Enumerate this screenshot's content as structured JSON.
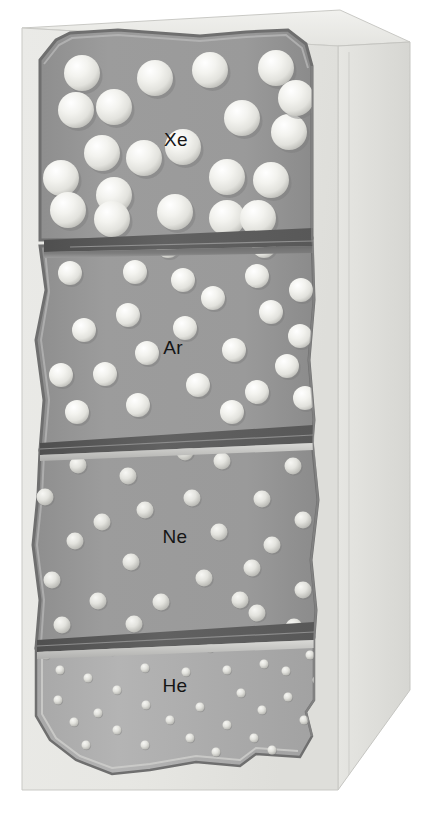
{
  "figure": {
    "background_color": "#ffffff",
    "outer_panel_color": "#e9e9e6",
    "outer_panel_shadow_color": "#dcdcd8",
    "outer_panel_edge_color": "#bdbdb8",
    "chamber_fill_color": "#9a9a9a",
    "chamber_fill_light_color": "#b2b2b2",
    "chamber_outline_color": "#6f6f6f",
    "divider_dark_color": "#5a5a5a",
    "divider_mid_color": "#777777",
    "divider_light_color": "#c8c8c8",
    "sphere_color": "#f0f0ec",
    "sphere_shade_color": "#bcbcba",
    "label_color": "#151515"
  },
  "chambers": [
    {
      "id": "xe",
      "label": "Xe",
      "element_name": "xenon",
      "label_x": 176,
      "label_y": 146,
      "sphere_radius": 18,
      "sphere_count": 21,
      "spheres": [
        {
          "cx": 82,
          "cy": 73
        },
        {
          "cx": 155,
          "cy": 78
        },
        {
          "cx": 210,
          "cy": 70
        },
        {
          "cx": 276,
          "cy": 68
        },
        {
          "cx": 76,
          "cy": 110
        },
        {
          "cx": 114,
          "cy": 107
        },
        {
          "cx": 242,
          "cy": 118
        },
        {
          "cx": 289,
          "cy": 132
        },
        {
          "cx": 102,
          "cy": 153
        },
        {
          "cx": 144,
          "cy": 158
        },
        {
          "cx": 183,
          "cy": 147
        },
        {
          "cx": 61,
          "cy": 178
        },
        {
          "cx": 227,
          "cy": 177
        },
        {
          "cx": 271,
          "cy": 180
        },
        {
          "cx": 114,
          "cy": 195
        },
        {
          "cx": 112,
          "cy": 219
        },
        {
          "cx": 68,
          "cy": 210
        },
        {
          "cx": 175,
          "cy": 212
        },
        {
          "cx": 227,
          "cy": 218
        },
        {
          "cx": 296,
          "cy": 98
        },
        {
          "cx": 258,
          "cy": 218
        }
      ]
    },
    {
      "id": "ar",
      "label": "Ar",
      "element_name": "argon",
      "label_x": 173,
      "label_y": 354,
      "sphere_radius": 12,
      "sphere_count": 24,
      "spheres": [
        {
          "cx": 70,
          "cy": 273
        },
        {
          "cx": 135,
          "cy": 272
        },
        {
          "cx": 183,
          "cy": 280
        },
        {
          "cx": 257,
          "cy": 276
        },
        {
          "cx": 301,
          "cy": 290
        },
        {
          "cx": 213,
          "cy": 298
        },
        {
          "cx": 128,
          "cy": 315
        },
        {
          "cx": 271,
          "cy": 312
        },
        {
          "cx": 84,
          "cy": 330
        },
        {
          "cx": 185,
          "cy": 328
        },
        {
          "cx": 300,
          "cy": 336
        },
        {
          "cx": 147,
          "cy": 353
        },
        {
          "cx": 234,
          "cy": 350
        },
        {
          "cx": 61,
          "cy": 375
        },
        {
          "cx": 105,
          "cy": 374
        },
        {
          "cx": 287,
          "cy": 366
        },
        {
          "cx": 198,
          "cy": 385
        },
        {
          "cx": 257,
          "cy": 392
        },
        {
          "cx": 305,
          "cy": 398
        },
        {
          "cx": 138,
          "cy": 405
        },
        {
          "cx": 232,
          "cy": 412
        },
        {
          "cx": 77,
          "cy": 412
        },
        {
          "cx": 168,
          "cy": 246
        },
        {
          "cx": 264,
          "cy": 246
        }
      ]
    },
    {
      "id": "ne",
      "label": "Ne",
      "element_name": "neon",
      "label_x": 175,
      "label_y": 543,
      "sphere_radius": 8.5,
      "sphere_count": 26,
      "spheres": [
        {
          "cx": 78,
          "cy": 465
        },
        {
          "cx": 128,
          "cy": 476
        },
        {
          "cx": 222,
          "cy": 461
        },
        {
          "cx": 293,
          "cy": 466
        },
        {
          "cx": 45,
          "cy": 497
        },
        {
          "cx": 192,
          "cy": 498
        },
        {
          "cx": 262,
          "cy": 499
        },
        {
          "cx": 145,
          "cy": 510
        },
        {
          "cx": 102,
          "cy": 522
        },
        {
          "cx": 219,
          "cy": 532
        },
        {
          "cx": 75,
          "cy": 541
        },
        {
          "cx": 272,
          "cy": 545
        },
        {
          "cx": 131,
          "cy": 562
        },
        {
          "cx": 303,
          "cy": 520
        },
        {
          "cx": 252,
          "cy": 568
        },
        {
          "cx": 204,
          "cy": 578
        },
        {
          "cx": 52,
          "cy": 580
        },
        {
          "cx": 303,
          "cy": 590
        },
        {
          "cx": 98,
          "cy": 601
        },
        {
          "cx": 161,
          "cy": 602
        },
        {
          "cx": 257,
          "cy": 613
        },
        {
          "cx": 62,
          "cy": 625
        },
        {
          "cx": 134,
          "cy": 624
        },
        {
          "cx": 294,
          "cy": 627
        },
        {
          "cx": 185,
          "cy": 452
        },
        {
          "cx": 240,
          "cy": 600
        }
      ]
    },
    {
      "id": "he",
      "label": "He",
      "element_name": "helium",
      "label_x": 175,
      "label_y": 692,
      "sphere_radius": 4.5,
      "sphere_count": 31,
      "spheres": [
        {
          "cx": 46,
          "cy": 655
        },
        {
          "cx": 112,
          "cy": 651
        },
        {
          "cx": 210,
          "cy": 648
        },
        {
          "cx": 264,
          "cy": 664
        },
        {
          "cx": 310,
          "cy": 655
        },
        {
          "cx": 60,
          "cy": 670
        },
        {
          "cx": 145,
          "cy": 668
        },
        {
          "cx": 186,
          "cy": 672
        },
        {
          "cx": 227,
          "cy": 670
        },
        {
          "cx": 286,
          "cy": 671
        },
        {
          "cx": 88,
          "cy": 678
        },
        {
          "cx": 117,
          "cy": 690
        },
        {
          "cx": 241,
          "cy": 693
        },
        {
          "cx": 288,
          "cy": 697
        },
        {
          "cx": 58,
          "cy": 700
        },
        {
          "cx": 146,
          "cy": 705
        },
        {
          "cx": 317,
          "cy": 680
        },
        {
          "cx": 98,
          "cy": 713
        },
        {
          "cx": 200,
          "cy": 707
        },
        {
          "cx": 262,
          "cy": 710
        },
        {
          "cx": 74,
          "cy": 722
        },
        {
          "cx": 170,
          "cy": 720
        },
        {
          "cx": 227,
          "cy": 725
        },
        {
          "cx": 304,
          "cy": 720
        },
        {
          "cx": 117,
          "cy": 730
        },
        {
          "cx": 190,
          "cy": 738
        },
        {
          "cx": 254,
          "cy": 738
        },
        {
          "cx": 145,
          "cy": 745
        },
        {
          "cx": 86,
          "cy": 745
        },
        {
          "cx": 272,
          "cy": 750
        },
        {
          "cx": 216,
          "cy": 752
        }
      ]
    }
  ],
  "dividers": [
    {
      "id": "divider-xe-ar",
      "y_left": 238,
      "y_right": 232
    },
    {
      "id": "divider-ar-ne",
      "y_left": 441,
      "y_right": 429
    },
    {
      "id": "divider-ne-he",
      "y_left": 637,
      "y_right": 626
    }
  ]
}
